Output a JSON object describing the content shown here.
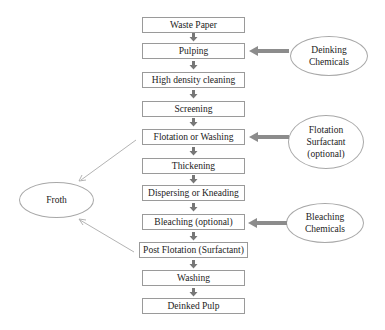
{
  "process_steps": [
    {
      "label": "Waste Paper",
      "top": 17
    },
    {
      "label": "Pulping",
      "top": 43
    },
    {
      "label": "High density cleaning",
      "top": 72
    },
    {
      "label": "Screening",
      "top": 101
    },
    {
      "label": "Flotation or Washing",
      "top": 129
    },
    {
      "label": "Thickening",
      "top": 158
    },
    {
      "label": "Dispersing or Kneading",
      "top": 185
    },
    {
      "label": "Bleaching (optional)",
      "top": 214
    },
    {
      "label": "Post Flotation (Surfactant)",
      "top": 242
    },
    {
      "label": "Washing",
      "top": 270
    },
    {
      "label": "Deinked Pulp",
      "top": 298
    }
  ],
  "inputs": {
    "deinking": {
      "line1": "Deinking",
      "line2": "Chemicals",
      "target_step": "Pulping"
    },
    "flotation": {
      "line1": "Flotation",
      "line2": "Surfactant",
      "line3": "(optional)",
      "target_step": "Flotation or Washing"
    },
    "bleaching": {
      "line1": "Bleaching",
      "line2": "Chemicals",
      "target_step": "Bleaching (optional)"
    }
  },
  "outputs": {
    "froth": {
      "label": "Froth",
      "sources": [
        "Flotation or Washing",
        "Post Flotation (Surfactant)"
      ]
    }
  },
  "colors": {
    "box_border": "#9a9a9a",
    "ellipse_border": "#a8a8a8",
    "thick_arrow": "#8c8c8c",
    "thin_arrow": "#a0a0a0"
  }
}
